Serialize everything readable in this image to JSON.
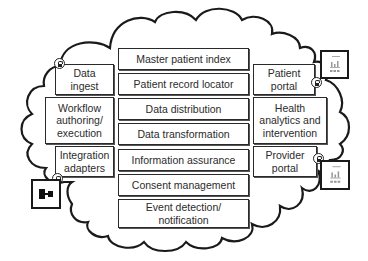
{
  "diagram": {
    "center_column": [
      {
        "label": "Master patient index"
      },
      {
        "label": "Patient record locator"
      },
      {
        "label": "Data distribution"
      },
      {
        "label": "Data transformation"
      },
      {
        "label": "Information assurance"
      },
      {
        "label": "Consent management"
      },
      {
        "label": "Event detection/\nnotification"
      }
    ],
    "left_column": [
      {
        "label": "Data\ningest",
        "locked": true
      },
      {
        "label": "Workflow\nauthoring/\nexecution",
        "locked": false
      },
      {
        "label": "Integration\nadapters",
        "locked": true
      }
    ],
    "right_column": [
      {
        "label": "Patient\nportal",
        "locked": true
      },
      {
        "label": "Health\nanalytics and\nintervention",
        "locked": false
      },
      {
        "label": "Provider\nportal",
        "locked": true
      }
    ],
    "external_icons": [
      {
        "name": "dashboard-tile-icon",
        "position": "top-right"
      },
      {
        "name": "dashboard-tile-icon",
        "position": "bottom-right"
      },
      {
        "name": "integration-connector-icon",
        "position": "bottom-left"
      }
    ],
    "colors": {
      "stroke": "#1a1a1a",
      "text": "#2b2b2b",
      "background": "#ffffff",
      "icon_gray": "#9a9a9a"
    }
  }
}
